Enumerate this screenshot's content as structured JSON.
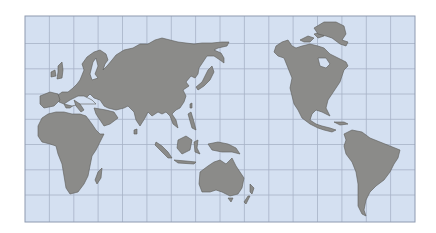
{
  "map": {
    "title": "World map (Pacific-centered)",
    "projection": "Miller cylindrical, centered on ~150°E",
    "frame": {
      "x": 25,
      "y": 16,
      "width": 390,
      "height": 206
    },
    "grid": {
      "columns": 16,
      "rows": 8
    },
    "colors": {
      "background": "#ffffff",
      "ocean": "#d4e0f1",
      "land": "#8b8b89",
      "coast": "#5a5a58",
      "grid": "#a7b2c6",
      "border": "#8e9ab0"
    },
    "regions": [
      {
        "id": "eurasia",
        "label": "Eurasia"
      },
      {
        "id": "africa",
        "label": "Africa"
      },
      {
        "id": "australia",
        "label": "Australia"
      },
      {
        "id": "north-america",
        "label": "North America"
      },
      {
        "id": "south-america",
        "label": "South America"
      },
      {
        "id": "greenland",
        "label": "Greenland"
      }
    ]
  }
}
